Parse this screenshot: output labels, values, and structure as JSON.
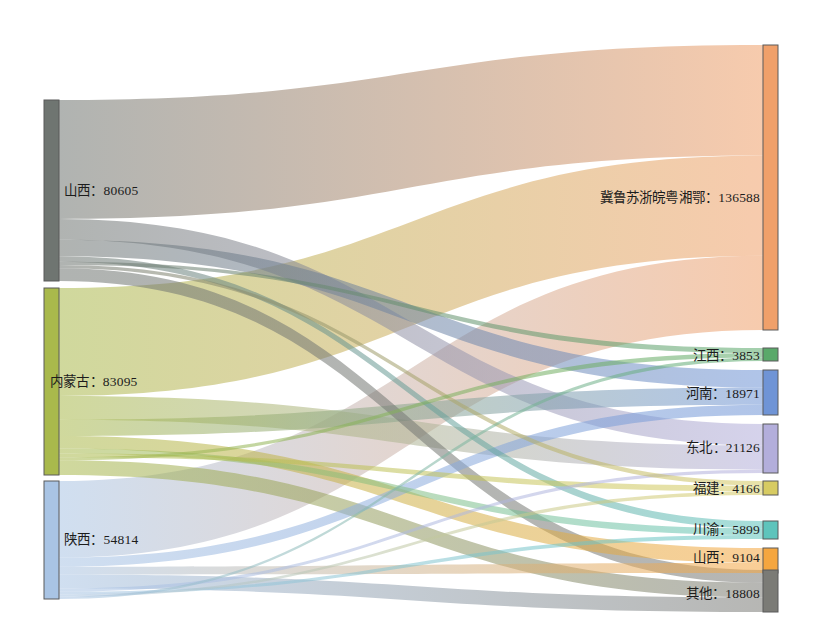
{
  "chart_data": {
    "type": "sankey",
    "title": "",
    "subtitle": "",
    "xlabel": "",
    "ylabel": "",
    "background_color": "#ffffff",
    "legend_position": "none",
    "grid": false,
    "label_format": "name: value",
    "label_separator": "：",
    "nodes": [
      {
        "id": "shanxi_src",
        "name": "山西",
        "value": 80605,
        "side": "left",
        "color": "#6f7571",
        "label": "山西：80605",
        "x": 44,
        "y": 100,
        "width": 15,
        "height": 181
      },
      {
        "id": "neimenggu",
        "name": "内蒙古",
        "value": 83095,
        "side": "left",
        "color": "#a9b94c",
        "label": "内蒙古：83095",
        "x": 44,
        "y": 288,
        "width": 15,
        "height": 187
      },
      {
        "id": "shaanxi",
        "name": "陕西",
        "value": 54814,
        "side": "left",
        "color": "#a9c4e4",
        "label": "陕西：54814",
        "x": 44,
        "y": 481,
        "width": 15,
        "height": 118
      },
      {
        "id": "jlszwyxe",
        "name": "冀鲁苏浙皖粤湘鄂",
        "value": 136588,
        "side": "right",
        "color": "#f0a06a",
        "label": "冀鲁苏浙皖粤湘鄂：136588",
        "x": 763,
        "y": 45,
        "width": 15,
        "height": 285
      },
      {
        "id": "jiangxi",
        "name": "江西",
        "value": 3853,
        "side": "right",
        "color": "#5aa96a",
        "label": "江西：3853",
        "x": 763,
        "y": 348,
        "width": 15,
        "height": 13
      },
      {
        "id": "henan",
        "name": "河南",
        "value": 18971,
        "side": "right",
        "color": "#6f94d6",
        "label": "河南：18971",
        "x": 763,
        "y": 370,
        "width": 15,
        "height": 45
      },
      {
        "id": "dongbei",
        "name": "东北",
        "value": 21126,
        "side": "right",
        "color": "#b3aedb",
        "label": "东北：21126",
        "x": 763,
        "y": 424,
        "width": 15,
        "height": 49
      },
      {
        "id": "fujian",
        "name": "福建",
        "value": 4166,
        "side": "right",
        "color": "#d7cb62",
        "label": "福建：4166",
        "x": 763,
        "y": 481,
        "width": 15,
        "height": 14
      },
      {
        "id": "chuanyu",
        "name": "川渝",
        "value": 5899,
        "side": "right",
        "color": "#5ec4bc",
        "label": "川渝：5899",
        "x": 763,
        "y": 521,
        "width": 15,
        "height": 18
      },
      {
        "id": "shanxi_dst",
        "name": "山西",
        "value": 9104,
        "side": "right",
        "color": "#f5a63f",
        "label": "山西：9104",
        "x": 763,
        "y": 548,
        "width": 15,
        "height": 25
      },
      {
        "id": "qita",
        "name": "其他",
        "value": 18808,
        "side": "right",
        "color": "#7b7b76",
        "label": "其他：18808",
        "x": 763,
        "y": 570,
        "width": 15,
        "height": 42
      }
    ],
    "links": [
      {
        "source": "shanxi_src",
        "target": "jlszwyxe",
        "value": 53000
      },
      {
        "source": "shanxi_src",
        "target": "dongbei",
        "value": 9200
      },
      {
        "source": "shanxi_src",
        "target": "henan",
        "value": 7400
      },
      {
        "source": "shanxi_src",
        "target": "chuanyu",
        "value": 2400
      },
      {
        "source": "shanxi_src",
        "target": "jiangxi",
        "value": 1500
      },
      {
        "source": "shanxi_src",
        "target": "fujian",
        "value": 1400
      },
      {
        "source": "shanxi_src",
        "target": "qita",
        "value": 5705
      },
      {
        "source": "neimenggu",
        "target": "jlszwyxe",
        "value": 48000
      },
      {
        "source": "neimenggu",
        "target": "dongbei",
        "value": 10500
      },
      {
        "source": "neimenggu",
        "target": "henan",
        "value": 7300
      },
      {
        "source": "neimenggu",
        "target": "shanxi_dst",
        "value": 5500
      },
      {
        "source": "neimenggu",
        "target": "chuanyu",
        "value": 2200
      },
      {
        "source": "neimenggu",
        "target": "fujian",
        "value": 1700
      },
      {
        "source": "neimenggu",
        "target": "jiangxi",
        "value": 1300
      },
      {
        "source": "neimenggu",
        "target": "qita",
        "value": 6595
      },
      {
        "source": "shaanxi",
        "target": "jlszwyxe",
        "value": 35588
      },
      {
        "source": "shaanxi",
        "target": "henan",
        "value": 4271
      },
      {
        "source": "shaanxi",
        "target": "shanxi_dst",
        "value": 3604
      },
      {
        "source": "shaanxi",
        "target": "qita",
        "value": 6508
      },
      {
        "source": "shaanxi",
        "target": "dongbei",
        "value": 1426
      },
      {
        "source": "shaanxi",
        "target": "chuanyu",
        "value": 1299
      },
      {
        "source": "shaanxi",
        "target": "fujian",
        "value": 1066
      },
      {
        "source": "shaanxi",
        "target": "jiangxi",
        "value": 1052
      }
    ]
  },
  "labels": {
    "shanxi_src": "山西：80605",
    "neimenggu": "内蒙古：83095",
    "shaanxi": "陕西：54814",
    "jlszwyxe": "冀鲁苏浙皖粤湘鄂：136588",
    "jiangxi": "江西：3853",
    "henan": "河南：18971",
    "dongbei": "东北：21126",
    "fujian": "福建：4166",
    "chuanyu": "川渝：5899",
    "shanxi_dst": "山西：9104",
    "qita": "其他：18808"
  }
}
